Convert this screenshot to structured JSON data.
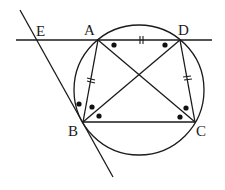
{
  "diagram": {
    "type": "geometry",
    "colors": {
      "stroke": "#1a1a1a",
      "background": "#ffffff"
    },
    "points": {
      "A": {
        "label": "A",
        "x": 98,
        "y": 40
      },
      "B": {
        "label": "B",
        "x": 83,
        "y": 122
      },
      "C": {
        "label": "C",
        "x": 195,
        "y": 122
      },
      "D": {
        "label": "D",
        "x": 180,
        "y": 40
      },
      "E": {
        "label": "E",
        "x": 36,
        "y": 40
      }
    },
    "circle": {
      "cx": 139,
      "cy": 90,
      "r": 65
    },
    "segments": [
      "AB",
      "BC",
      "CD",
      "AD",
      "AC",
      "BD"
    ],
    "lines": [
      {
        "name": "line-ED",
        "from": [
          16,
          40
        ],
        "to": [
          212,
          40
        ]
      },
      {
        "name": "tangent-at-B",
        "from": [
          20,
          10
        ],
        "to": [
          113,
          177
        ]
      }
    ],
    "equal_marks": [
      "AB",
      "AD",
      "DC"
    ],
    "angle_dots": [
      "angle DAC",
      "angle ADB",
      "angle EBA",
      "angle ABD",
      "angle DBC",
      "angle ACB",
      "angle ACD"
    ]
  }
}
